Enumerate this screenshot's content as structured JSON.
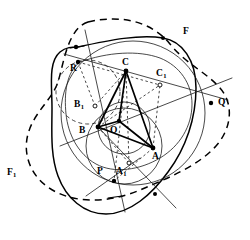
{
  "figure": {
    "kind": "geometry-construction",
    "width": 250,
    "height": 240,
    "background_color": "#ffffff",
    "ink_color": "#000000"
  },
  "labels": [
    {
      "name": "label-R",
      "text": "R",
      "sub": "",
      "x": 70,
      "y": 64
    },
    {
      "name": "label-C",
      "text": "C",
      "sub": "",
      "x": 122,
      "y": 58
    },
    {
      "name": "label-C1",
      "text": "C",
      "sub": "1",
      "x": 156,
      "y": 69
    },
    {
      "name": "label-F",
      "text": "F",
      "sub": "",
      "x": 183,
      "y": 27
    },
    {
      "name": "label-Q",
      "text": "Q",
      "sub": "",
      "x": 218,
      "y": 98
    },
    {
      "name": "label-B1",
      "text": "B",
      "sub": "1",
      "x": 74,
      "y": 100
    },
    {
      "name": "label-B",
      "text": "B",
      "sub": "",
      "x": 79,
      "y": 126
    },
    {
      "name": "label-O",
      "text": "O",
      "sub": "",
      "x": 110,
      "y": 126
    },
    {
      "name": "label-A",
      "text": "A",
      "sub": "",
      "x": 152,
      "y": 152
    },
    {
      "name": "label-P",
      "text": "P",
      "sub": "",
      "x": 97,
      "y": 167
    },
    {
      "name": "label-A1",
      "text": "A",
      "sub": "1",
      "x": 116,
      "y": 167
    },
    {
      "name": "label-F1",
      "text": "F",
      "sub": "1",
      "x": 7,
      "y": 168
    }
  ],
  "points": [
    {
      "name": "point-R",
      "x": 76,
      "y": 47,
      "style": "dot"
    },
    {
      "name": "point-R2",
      "x": 78,
      "y": 62,
      "style": "dot"
    },
    {
      "name": "point-C",
      "x": 126,
      "y": 71,
      "style": "dot"
    },
    {
      "name": "point-C1",
      "x": 160,
      "y": 85,
      "style": "ring"
    },
    {
      "name": "point-Q",
      "x": 211,
      "y": 103,
      "style": "dot"
    },
    {
      "name": "point-B1",
      "x": 95,
      "y": 106,
      "style": "ring"
    },
    {
      "name": "point-B",
      "x": 98,
      "y": 127,
      "style": "dot"
    },
    {
      "name": "point-O",
      "x": 119,
      "y": 121,
      "style": "dot"
    },
    {
      "name": "point-A",
      "x": 153,
      "y": 148,
      "style": "dot"
    },
    {
      "name": "point-A1",
      "x": 129,
      "y": 163,
      "style": "ring"
    },
    {
      "name": "point-P",
      "x": 114,
      "y": 181,
      "style": "dot"
    },
    {
      "name": "point-F",
      "x": 163,
      "y": 38,
      "style": "dot"
    },
    {
      "name": "point-Fb",
      "x": 155,
      "y": 194,
      "style": "dot"
    }
  ],
  "segments": [
    {
      "name": "segment-CB",
      "weight": "heavy",
      "dash": "solid"
    },
    {
      "name": "segment-CA",
      "weight": "heavy",
      "dash": "solid"
    },
    {
      "name": "segment-BA",
      "weight": "heavy",
      "dash": "solid"
    },
    {
      "name": "segment-CO",
      "weight": "heavy",
      "dash": "solid"
    },
    {
      "name": "segment-BO",
      "weight": "heavy",
      "dash": "solid"
    },
    {
      "name": "segment-OA",
      "weight": "heavy",
      "dash": "solid"
    },
    {
      "name": "segment-B-C1",
      "weight": "light",
      "dash": "dashed"
    },
    {
      "name": "segment-C-A1",
      "weight": "light",
      "dash": "dotted"
    },
    {
      "name": "segment-B-A1",
      "weight": "light",
      "dash": "dotted"
    },
    {
      "name": "segment-A-C1",
      "weight": "light",
      "dash": "dotted"
    },
    {
      "name": "segment-R-Q-axis",
      "weight": "light",
      "dash": "solid"
    },
    {
      "name": "segment-R-P-axis",
      "weight": "light",
      "dash": "solid"
    }
  ],
  "curves": [
    {
      "name": "curve-outer-solid",
      "style": "solid-heavy"
    },
    {
      "name": "curve-outer-dashed",
      "style": "dashed-heavy"
    },
    {
      "name": "curve-inner-solid",
      "style": "solid-light"
    },
    {
      "name": "circle-circumscribed",
      "style": "light"
    },
    {
      "name": "circle-incircle",
      "style": "light"
    },
    {
      "name": "circle-left-dashed",
      "style": "dashed-light"
    },
    {
      "name": "circle-nine-point",
      "style": "light"
    }
  ]
}
